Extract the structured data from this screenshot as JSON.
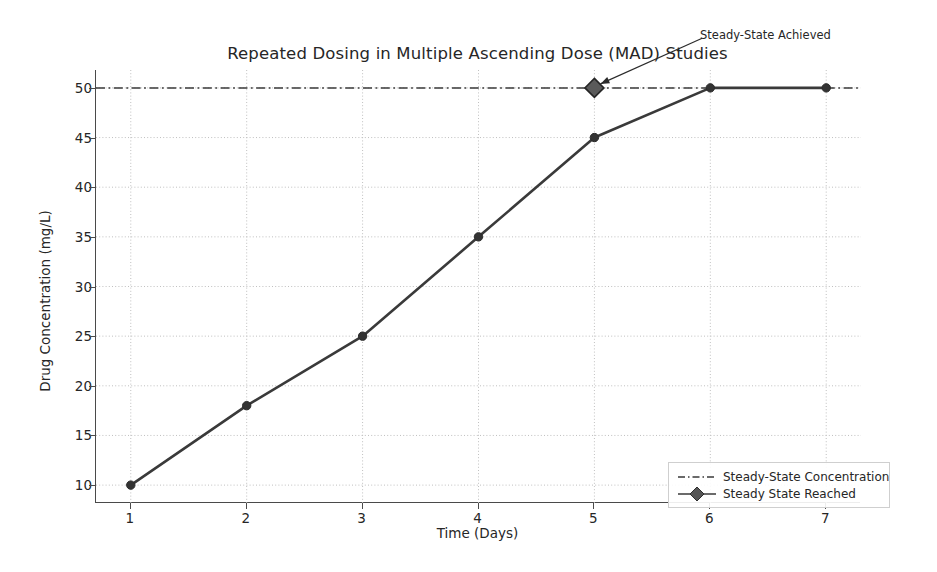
{
  "chart_data": {
    "type": "line",
    "title": "Repeated Dosing in Multiple Ascending Dose (MAD) Studies",
    "xlabel": "Time (Days)",
    "ylabel": "Drug Concentration (mg/L)",
    "x": [
      1,
      2,
      3,
      4,
      5,
      6,
      7
    ],
    "series": [
      {
        "name": "Drug Concentration",
        "values": [
          10,
          18,
          25,
          35,
          45,
          50,
          50
        ],
        "color": "#3a3a3a",
        "marker": "circle"
      }
    ],
    "reference_line": {
      "name": "Steady-State Concentration",
      "value": 50,
      "style": "dashdot",
      "color": "#3a3a3a"
    },
    "highlight_points": [
      {
        "name": "Steady State Reached",
        "x": 5,
        "y": 50,
        "color": "#3a3a3a",
        "marker": "diamond"
      }
    ],
    "annotations": [
      {
        "text": "Steady-State Achieved",
        "point_x": 5,
        "point_y": 50,
        "text_x": 5.55,
        "text_y": 54.8
      }
    ],
    "xlim": [
      0.7,
      7.3
    ],
    "ylim": [
      8.2,
      51.8
    ],
    "xticks": [
      1,
      2,
      3,
      4,
      5,
      6,
      7
    ],
    "xtick_labels": [
      "1",
      "2",
      "3",
      "4",
      "5",
      "6",
      "7"
    ],
    "yticks": [
      10,
      15,
      20,
      25,
      30,
      35,
      40,
      45,
      50
    ],
    "ytick_labels": [
      "10",
      "15",
      "20",
      "25",
      "30",
      "35",
      "40",
      "45",
      "50"
    ],
    "grid": true,
    "grid_style": "dotted",
    "legend_position": "lower right",
    "legend_entries": [
      "Steady-State Concentration",
      "Steady State Reached"
    ],
    "background_color": "#ffffff"
  }
}
